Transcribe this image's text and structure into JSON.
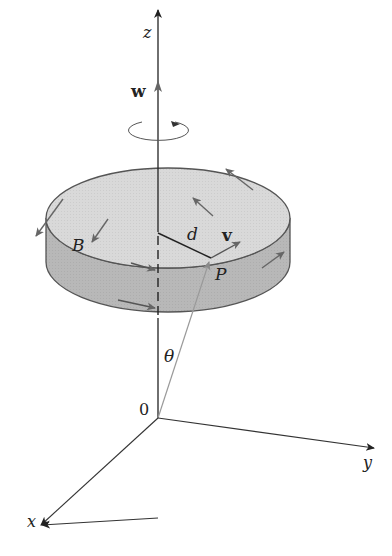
{
  "diagram": {
    "type": "rotating-disk-angular-velocity",
    "axes": {
      "x_label": "x",
      "y_label": "y",
      "z_label": "z",
      "origin_label": "0"
    },
    "labels": {
      "angular_velocity": "w",
      "body": "B",
      "distance": "d",
      "velocity": "v",
      "point": "P",
      "angle": "θ"
    },
    "colors": {
      "disk_top": "#d9d9d9",
      "disk_side": "#b8b8b8",
      "outline": "#555555",
      "axis": "#222222",
      "arrow": "#666666",
      "position_vector": "#9a9a9a"
    }
  }
}
